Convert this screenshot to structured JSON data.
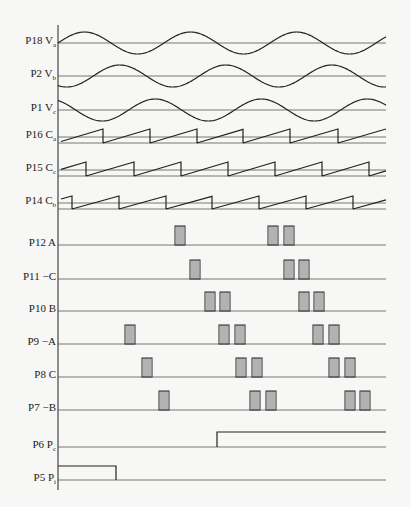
{
  "figure": {
    "title": "",
    "axis_x": 58,
    "axis_right": 386,
    "stroke_color": "#222222",
    "background": "#f7f7f5"
  },
  "rows": [
    {
      "id": "P18",
      "label": "P18 V",
      "sub": "a",
      "kind": "sine",
      "y": 43,
      "amp": 11,
      "phase": 0,
      "period": 106
    },
    {
      "id": "P2",
      "label": "P2 V",
      "sub": "b",
      "kind": "sine",
      "y": 76,
      "amp": 11,
      "phase": -2.094,
      "period": 106
    },
    {
      "id": "P1",
      "label": "P1 V",
      "sub": "c",
      "kind": "sine",
      "y": 110,
      "amp": 11,
      "phase": 2.094,
      "period": 106
    },
    {
      "id": "P16",
      "label": "P16 C",
      "sub": "a",
      "kind": "saw",
      "y": 137,
      "low": 143,
      "high": 129,
      "teeth": [
        [
          61,
          103
        ],
        [
          103,
          150
        ],
        [
          150,
          197
        ],
        [
          197,
          243
        ],
        [
          243,
          290
        ],
        [
          290,
          338
        ],
        [
          338,
          386
        ]
      ]
    },
    {
      "id": "P15",
      "label": "P15 C",
      "sub": "c",
      "kind": "saw",
      "y": 170,
      "low": 176,
      "high": 162,
      "teeth": [
        [
          61,
          86
        ],
        [
          86,
          134
        ],
        [
          134,
          181
        ],
        [
          181,
          228
        ],
        [
          228,
          275
        ],
        [
          275,
          322
        ],
        [
          322,
          369
        ],
        [
          369,
          386
        ]
      ]
    },
    {
      "id": "P14",
      "label": "P14 C",
      "sub": "b",
      "kind": "saw",
      "y": 203,
      "low": 209,
      "high": 196,
      "teeth": [
        [
          61,
          72
        ],
        [
          72,
          119
        ],
        [
          119,
          166
        ],
        [
          166,
          212
        ],
        [
          212,
          259
        ],
        [
          259,
          306
        ],
        [
          306,
          353
        ],
        [
          353,
          386
        ]
      ]
    },
    {
      "id": "P12",
      "label": "P12 A",
      "sub": "",
      "kind": "pulse",
      "y": 245,
      "pulses": [
        175,
        268,
        284
      ]
    },
    {
      "id": "P11",
      "label": "P11 −C",
      "sub": "",
      "kind": "pulse",
      "y": 279,
      "pulses": [
        190,
        284,
        299
      ]
    },
    {
      "id": "P10",
      "label": "P10 B",
      "sub": "",
      "kind": "pulse",
      "y": 311,
      "pulses": [
        205,
        220,
        299,
        314
      ]
    },
    {
      "id": "P9",
      "label": "P9 −A",
      "sub": "",
      "kind": "pulse",
      "y": 344,
      "pulses": [
        125,
        219,
        235,
        313,
        329
      ]
    },
    {
      "id": "P8",
      "label": "P8 C",
      "sub": "",
      "kind": "pulse",
      "y": 377,
      "pulses": [
        142,
        236,
        252,
        329,
        345
      ]
    },
    {
      "id": "P7",
      "label": "P7 −B",
      "sub": "",
      "kind": "pulse",
      "y": 410,
      "pulses": [
        159,
        250,
        266,
        345,
        360
      ]
    },
    {
      "id": "P6",
      "label": "P6 P",
      "sub": "c",
      "kind": "step",
      "y": 447,
      "rise_x": 217,
      "high": 432,
      "from": 58,
      "to": 386,
      "start_high": false
    },
    {
      "id": "P5",
      "label": "P5 P",
      "sub": "i",
      "kind": "step",
      "y": 480,
      "rise_x": 116,
      "high": 466,
      "from": 58,
      "to": 386,
      "start_high": true
    }
  ],
  "pulse_width": 10,
  "pulse_height": 19
}
